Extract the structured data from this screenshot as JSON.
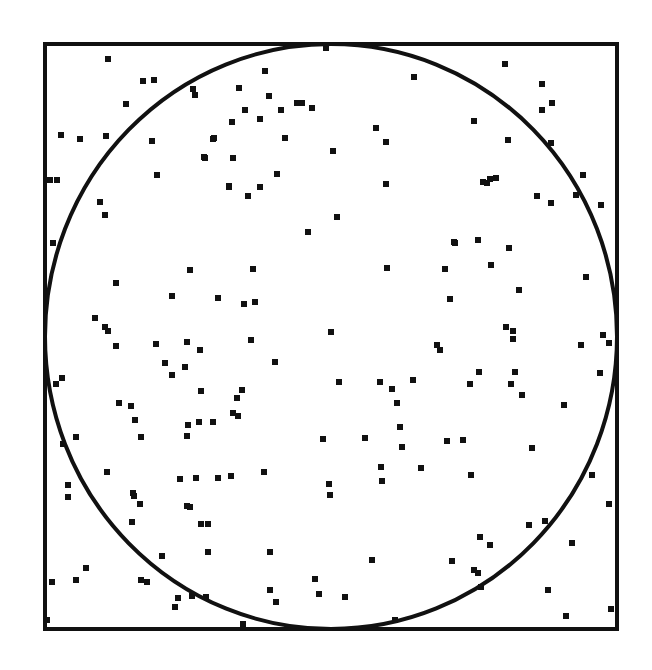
{
  "diagram": {
    "type": "monte-carlo-pi-estimation",
    "colors": {
      "background": "#ffffff",
      "stroke": "#111111",
      "point": "#111111"
    },
    "square": {
      "x": 45,
      "y": 44,
      "width": 572,
      "height": 585,
      "stroke_width": 4
    },
    "circle": {
      "cx": 331,
      "cy": 336.5,
      "rx": 286,
      "ry": 292.5,
      "stroke_width": 4
    },
    "point_size": 6,
    "points": [
      [
        108,
        59
      ],
      [
        143,
        81
      ],
      [
        154,
        80
      ],
      [
        193,
        89
      ],
      [
        195,
        95
      ],
      [
        126,
        104
      ],
      [
        61,
        135
      ],
      [
        80,
        139
      ],
      [
        106,
        136
      ],
      [
        152,
        141
      ],
      [
        213,
        139
      ],
      [
        204,
        157
      ],
      [
        233,
        158
      ],
      [
        50,
        180
      ],
      [
        57,
        180
      ],
      [
        157,
        175
      ],
      [
        229,
        186
      ],
      [
        326,
        48
      ],
      [
        265,
        71
      ],
      [
        239,
        88
      ],
      [
        269,
        96
      ],
      [
        245,
        110
      ],
      [
        297,
        103
      ],
      [
        302,
        103
      ],
      [
        312,
        108
      ],
      [
        281,
        110
      ],
      [
        232,
        122
      ],
      [
        260,
        119
      ],
      [
        214,
        138
      ],
      [
        285,
        138
      ],
      [
        376,
        128
      ],
      [
        386,
        142
      ],
      [
        333,
        151
      ],
      [
        205,
        158
      ],
      [
        277,
        174
      ],
      [
        229,
        187
      ],
      [
        260,
        187
      ],
      [
        248,
        196
      ],
      [
        386,
        184
      ],
      [
        414,
        77
      ],
      [
        505,
        64
      ],
      [
        542,
        84
      ],
      [
        552,
        103
      ],
      [
        542,
        110
      ],
      [
        474,
        121
      ],
      [
        508,
        140
      ],
      [
        551,
        143
      ],
      [
        483,
        182
      ],
      [
        487,
        183
      ],
      [
        490,
        179
      ],
      [
        496,
        178
      ],
      [
        537,
        196
      ],
      [
        551,
        203
      ],
      [
        583,
        175
      ],
      [
        576,
        195
      ],
      [
        601,
        205
      ],
      [
        100,
        202
      ],
      [
        105,
        215
      ],
      [
        53,
        243
      ],
      [
        116,
        283
      ],
      [
        190,
        270
      ],
      [
        172,
        296
      ],
      [
        218,
        298
      ],
      [
        253,
        269
      ],
      [
        244,
        304
      ],
      [
        255,
        302
      ],
      [
        95,
        318
      ],
      [
        105,
        327
      ],
      [
        108,
        331
      ],
      [
        116,
        346
      ],
      [
        156,
        344
      ],
      [
        187,
        342
      ],
      [
        200,
        350
      ],
      [
        251,
        340
      ],
      [
        337,
        217
      ],
      [
        308,
        232
      ],
      [
        454,
        242
      ],
      [
        387,
        268
      ],
      [
        445,
        269
      ],
      [
        331,
        332
      ],
      [
        437,
        345
      ],
      [
        440,
        350
      ],
      [
        275,
        362
      ],
      [
        455,
        243
      ],
      [
        478,
        240
      ],
      [
        509,
        248
      ],
      [
        491,
        265
      ],
      [
        519,
        290
      ],
      [
        586,
        277
      ],
      [
        450,
        299
      ],
      [
        506,
        327
      ],
      [
        513,
        331
      ],
      [
        513,
        339
      ],
      [
        603,
        335
      ],
      [
        581,
        345
      ],
      [
        609,
        343
      ],
      [
        479,
        372
      ],
      [
        515,
        372
      ],
      [
        470,
        384
      ],
      [
        511,
        384
      ],
      [
        522,
        395
      ],
      [
        600,
        373
      ],
      [
        564,
        405
      ],
      [
        56,
        384
      ],
      [
        62,
        378
      ],
      [
        119,
        403
      ],
      [
        131,
        406
      ],
      [
        135,
        420
      ],
      [
        141,
        437
      ],
      [
        165,
        363
      ],
      [
        172,
        375
      ],
      [
        185,
        367
      ],
      [
        201,
        391
      ],
      [
        188,
        425
      ],
      [
        187,
        436
      ],
      [
        199,
        422
      ],
      [
        213,
        422
      ],
      [
        233,
        413
      ],
      [
        237,
        398
      ],
      [
        238,
        416
      ],
      [
        242,
        390
      ],
      [
        76,
        437
      ],
      [
        63,
        444
      ],
      [
        107,
        472
      ],
      [
        68,
        485
      ],
      [
        339,
        382
      ],
      [
        380,
        382
      ],
      [
        392,
        389
      ],
      [
        413,
        380
      ],
      [
        397,
        403
      ],
      [
        400,
        427
      ],
      [
        402,
        447
      ],
      [
        323,
        439
      ],
      [
        365,
        438
      ],
      [
        447,
        441
      ],
      [
        463,
        440
      ],
      [
        264,
        472
      ],
      [
        381,
        467
      ],
      [
        382,
        481
      ],
      [
        421,
        468
      ],
      [
        329,
        484
      ],
      [
        330,
        495
      ],
      [
        532,
        448
      ],
      [
        471,
        475
      ],
      [
        592,
        475
      ],
      [
        609,
        504
      ],
      [
        529,
        525
      ],
      [
        545,
        521
      ],
      [
        572,
        543
      ],
      [
        480,
        537
      ],
      [
        490,
        545
      ],
      [
        452,
        561
      ],
      [
        474,
        570
      ],
      [
        478,
        573
      ],
      [
        481,
        587
      ],
      [
        548,
        590
      ],
      [
        566,
        616
      ],
      [
        611,
        609
      ],
      [
        68,
        497
      ],
      [
        133,
        493
      ],
      [
        140,
        504
      ],
      [
        132,
        522
      ],
      [
        187,
        506
      ],
      [
        201,
        524
      ],
      [
        208,
        524
      ],
      [
        208,
        552
      ],
      [
        162,
        556
      ],
      [
        86,
        568
      ],
      [
        76,
        580
      ],
      [
        52,
        582
      ],
      [
        141,
        580
      ],
      [
        147,
        582
      ],
      [
        178,
        598
      ],
      [
        175,
        607
      ],
      [
        192,
        596
      ],
      [
        206,
        597
      ],
      [
        47,
        620
      ],
      [
        243,
        624
      ],
      [
        270,
        552
      ],
      [
        372,
        560
      ],
      [
        315,
        579
      ],
      [
        270,
        590
      ],
      [
        276,
        602
      ],
      [
        319,
        594
      ],
      [
        345,
        597
      ],
      [
        395,
        620
      ],
      [
        218,
        478
      ],
      [
        231,
        476
      ],
      [
        196,
        478
      ],
      [
        180,
        479
      ],
      [
        190,
        507
      ],
      [
        134,
        496
      ]
    ]
  }
}
